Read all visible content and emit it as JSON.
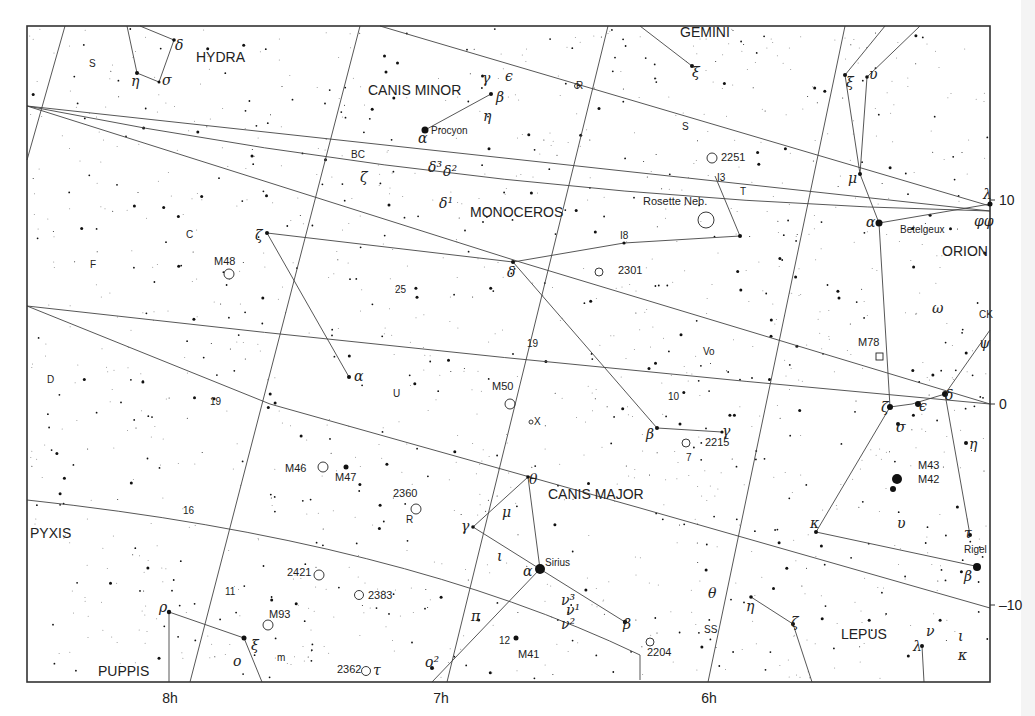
{
  "chart_data": {
    "type": "star-chart",
    "title": "",
    "ra_labels": [
      "8h",
      "7h",
      "6h"
    ],
    "dec_labels": [
      "10",
      "0",
      "-10"
    ],
    "constellations": [
      "HYDRA",
      "CANIS MINOR",
      "GEMINI",
      "MONOCEROS",
      "ORION",
      "PYXIS",
      "CANIS MAJOR",
      "PUPPIS",
      "LEPUS"
    ],
    "named_stars": [
      "Procyon",
      "Betelgeux",
      "Sirius",
      "Rigel"
    ],
    "deep_sky": [
      "M48",
      "M50",
      "M46",
      "M47",
      "M93",
      "M41",
      "M78",
      "M43",
      "M42",
      "2251",
      "2301",
      "2215",
      "2360",
      "2421",
      "2383",
      "2362",
      "2204",
      "Rosette Neb."
    ],
    "star_labels": [
      "S",
      "C",
      "F",
      "D",
      "19",
      "16",
      "11",
      "BC",
      "25",
      "19",
      "U",
      "R",
      "S",
      "I3",
      "T",
      "I8",
      "Vo",
      "10",
      "X",
      "R",
      "12",
      "m",
      "SS",
      "CK",
      "7"
    ],
    "greek_labels": [
      "δ",
      "η",
      "σ",
      "γ",
      "ε",
      "β",
      "η",
      "α",
      "δ³",
      "δ²",
      "δ¹",
      "ζ",
      "ζ",
      "α",
      "δ",
      "β",
      "γ",
      "ξ",
      "ξ",
      "ν",
      "μ",
      "α",
      "λ",
      "φφ",
      "ω",
      "ψ",
      "ζ",
      "ε",
      "δ",
      "σ",
      "η",
      "υ",
      "κ",
      "τ",
      "β",
      "θ",
      "μ",
      "γ",
      "ι",
      "α",
      "π",
      "ν³",
      "ν¹",
      "ν²",
      "β",
      "ο²",
      "τ",
      "ρ",
      "ξ",
      "ο",
      "θ",
      "η",
      "ζ",
      "λ",
      "ν",
      "ι",
      "κ"
    ]
  },
  "axes": {
    "ra": [
      {
        "label": "8h",
        "x": 170
      },
      {
        "label": "7h",
        "x": 441
      },
      {
        "label": "6h",
        "x": 709
      }
    ],
    "dec": [
      {
        "label": "10",
        "y": 200
      },
      {
        "label": "0",
        "y": 404
      },
      {
        "label": "10",
        "y": 605,
        "prefix": "–"
      }
    ]
  },
  "constellations": [
    {
      "name": "HYDRA",
      "x": 196,
      "y": 62
    },
    {
      "name": "CANIS MINOR",
      "x": 368,
      "y": 95
    },
    {
      "name": "GEMINI",
      "x": 680,
      "y": 37
    },
    {
      "name": "MONOCEROS",
      "x": 470,
      "y": 217
    },
    {
      "name": "ORION",
      "x": 942,
      "y": 256
    },
    {
      "name": "PYXIS",
      "x": 30,
      "y": 538
    },
    {
      "name": "CANIS MAJOR",
      "x": 548,
      "y": 499
    },
    {
      "name": "PUPPIS",
      "x": 98,
      "y": 676
    },
    {
      "name": "LEPUS",
      "x": 841,
      "y": 639
    }
  ],
  "named_stars": [
    {
      "name": "Procyon",
      "x": 431,
      "y": 134
    },
    {
      "name": "Betelgeux",
      "x": 900,
      "y": 233
    },
    {
      "name": "Sirius",
      "x": 545,
      "y": 566
    },
    {
      "name": "Rigel",
      "x": 964,
      "y": 553
    }
  ],
  "deep_sky": [
    {
      "name": "M48",
      "x": 214,
      "y": 265,
      "cx": 229,
      "cy": 274
    },
    {
      "name": "M50",
      "x": 492,
      "y": 390,
      "cx": 510,
      "cy": 404
    },
    {
      "name": "M46",
      "x": 285,
      "y": 472,
      "cx": 323,
      "cy": 467
    },
    {
      "name": "M47",
      "x": 335,
      "y": 481,
      "cx": null,
      "cy": null
    },
    {
      "name": "M93",
      "x": 269,
      "y": 618,
      "cx": 268,
      "cy": 625
    },
    {
      "name": "M41",
      "x": 518,
      "y": 658,
      "cx": null,
      "cy": null
    },
    {
      "name": "M78",
      "x": 858,
      "y": 346,
      "cx": null,
      "cy": null
    },
    {
      "name": "M43",
      "x": 918,
      "y": 469,
      "cx": null,
      "cy": null
    },
    {
      "name": "M42",
      "x": 918,
      "y": 483,
      "cx": null,
      "cy": null
    },
    {
      "name": "2251",
      "x": 721,
      "y": 161,
      "cx": 712,
      "cy": 158
    },
    {
      "name": "2301",
      "x": 618,
      "y": 274,
      "cx": 599,
      "cy": 272
    },
    {
      "name": "2215",
      "x": 705,
      "y": 446,
      "cx": 686,
      "cy": 443
    },
    {
      "name": "2360",
      "x": 393,
      "y": 497,
      "cx": 416,
      "cy": 509
    },
    {
      "name": "2421",
      "x": 287,
      "y": 576,
      "cx": 319,
      "cy": 575
    },
    {
      "name": "2383",
      "x": 368,
      "y": 599,
      "cx": 359,
      "cy": 595
    },
    {
      "name": "2362",
      "x": 337,
      "y": 673,
      "cx": 366,
      "cy": 671
    },
    {
      "name": "2204",
      "x": 647,
      "y": 656,
      "cx": 650,
      "cy": 642
    },
    {
      "name": "Rosette Neb.",
      "x": 643,
      "y": 205,
      "cx": 706,
      "cy": 220
    }
  ],
  "letters": [
    {
      "t": "S",
      "x": 89,
      "y": 67
    },
    {
      "t": "C",
      "x": 186,
      "y": 238
    },
    {
      "t": "F",
      "x": 90,
      "y": 268
    },
    {
      "t": "D",
      "x": 47,
      "y": 383
    },
    {
      "t": "19",
      "x": 210,
      "y": 405
    },
    {
      "t": "16",
      "x": 183,
      "y": 514
    },
    {
      "t": "11",
      "x": 225,
      "y": 595
    },
    {
      "t": "BC",
      "x": 351,
      "y": 158
    },
    {
      "t": "25",
      "x": 395,
      "y": 293
    },
    {
      "t": "19",
      "x": 527,
      "y": 347
    },
    {
      "t": "U",
      "x": 393,
      "y": 397
    },
    {
      "t": "R",
      "x": 576,
      "y": 89
    },
    {
      "t": "S",
      "x": 682,
      "y": 130
    },
    {
      "t": "I3",
      "x": 717,
      "y": 181
    },
    {
      "t": "T",
      "x": 740,
      "y": 195
    },
    {
      "t": "I8",
      "x": 620,
      "y": 239
    },
    {
      "t": "Vo",
      "x": 703,
      "y": 355
    },
    {
      "t": "10",
      "x": 668,
      "y": 400
    },
    {
      "t": "X",
      "x": 534,
      "y": 425
    },
    {
      "t": "R",
      "x": 406,
      "y": 523
    },
    {
      "t": "12",
      "x": 499,
      "y": 644
    },
    {
      "t": "m",
      "x": 277,
      "y": 661
    },
    {
      "t": "SS",
      "x": 704,
      "y": 633
    },
    {
      "t": "CK",
      "x": 979,
      "y": 318
    },
    {
      "t": "7",
      "x": 686,
      "y": 461
    }
  ],
  "greek": [
    {
      "t": "δ",
      "x": 175,
      "y": 50
    },
    {
      "t": "η",
      "x": 131,
      "y": 86
    },
    {
      "t": "σ",
      "x": 162,
      "y": 85
    },
    {
      "t": "γ",
      "x": 482,
      "y": 83
    },
    {
      "t": "ϵ",
      "x": 505,
      "y": 81
    },
    {
      "t": "β",
      "x": 496,
      "y": 102
    },
    {
      "t": "η",
      "x": 483,
      "y": 121
    },
    {
      "t": "α",
      "x": 418,
      "y": 143
    },
    {
      "t": "δ³",
      "x": 428,
      "y": 172
    },
    {
      "t": "δ²",
      "x": 443,
      "y": 176
    },
    {
      "t": "δ¹",
      "x": 439,
      "y": 208
    },
    {
      "t": "ζ",
      "x": 360,
      "y": 182
    },
    {
      "t": "ζ",
      "x": 255,
      "y": 240
    },
    {
      "t": "α",
      "x": 354,
      "y": 381
    },
    {
      "t": "δ",
      "x": 507,
      "y": 277
    },
    {
      "t": "β",
      "x": 646,
      "y": 439
    },
    {
      "t": "γ",
      "x": 722,
      "y": 436
    },
    {
      "t": "ξ",
      "x": 692,
      "y": 77
    },
    {
      "t": "ξ",
      "x": 846,
      "y": 87
    },
    {
      "t": "υ",
      "x": 869,
      "y": 79
    },
    {
      "t": "μ",
      "x": 848,
      "y": 183
    },
    {
      "t": "α",
      "x": 866,
      "y": 227
    },
    {
      "t": "λ",
      "x": 983,
      "y": 199
    },
    {
      "t": "φφ",
      "x": 974,
      "y": 226
    },
    {
      "t": "ω",
      "x": 932,
      "y": 313
    },
    {
      "t": "ψ",
      "x": 979,
      "y": 348
    },
    {
      "t": "ζ",
      "x": 881,
      "y": 412
    },
    {
      "t": "ϵ",
      "x": 919,
      "y": 411
    },
    {
      "t": "δ",
      "x": 945,
      "y": 400
    },
    {
      "t": "σ",
      "x": 896,
      "y": 432
    },
    {
      "t": "η",
      "x": 969,
      "y": 449
    },
    {
      "t": "υ",
      "x": 897,
      "y": 528
    },
    {
      "t": "κ",
      "x": 810,
      "y": 528
    },
    {
      "t": "τ",
      "x": 964,
      "y": 538
    },
    {
      "t": "β",
      "x": 964,
      "y": 581
    },
    {
      "t": "θ",
      "x": 529,
      "y": 484
    },
    {
      "t": "μ",
      "x": 502,
      "y": 517
    },
    {
      "t": "γ",
      "x": 461,
      "y": 531
    },
    {
      "t": "ι",
      "x": 497,
      "y": 561
    },
    {
      "t": "α",
      "x": 523,
      "y": 576
    },
    {
      "t": "π",
      "x": 471,
      "y": 621
    },
    {
      "t": "ν³",
      "x": 561,
      "y": 605
    },
    {
      "t": "ν¹",
      "x": 566,
      "y": 615
    },
    {
      "t": "ν²",
      "x": 561,
      "y": 629
    },
    {
      "t": "β",
      "x": 623,
      "y": 629
    },
    {
      "t": "ο²",
      "x": 425,
      "y": 667
    },
    {
      "t": "τ",
      "x": 373,
      "y": 675
    },
    {
      "t": "ρ",
      "x": 159,
      "y": 612
    },
    {
      "t": "ξ",
      "x": 251,
      "y": 650
    },
    {
      "t": "ο",
      "x": 233,
      "y": 666
    },
    {
      "t": "θ",
      "x": 708,
      "y": 598
    },
    {
      "t": "η",
      "x": 746,
      "y": 611
    },
    {
      "t": "ζ",
      "x": 791,
      "y": 627
    },
    {
      "t": "λ",
      "x": 913,
      "y": 651
    },
    {
      "t": "ν",
      "x": 926,
      "y": 636
    },
    {
      "t": "ι",
      "x": 958,
      "y": 641
    },
    {
      "t": "κ",
      "x": 958,
      "y": 660
    }
  ]
}
